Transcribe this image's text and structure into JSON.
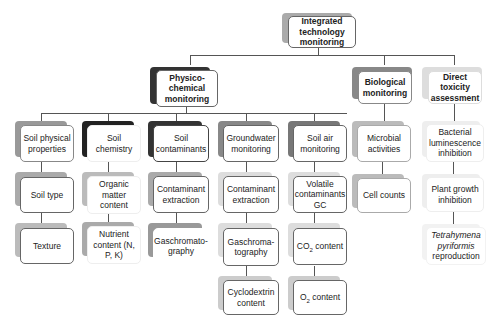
{
  "diagram": {
    "root": {
      "label": "Integrated technology monitoring"
    },
    "level1": [
      {
        "label": "Physico-chemical monitoring"
      },
      {
        "label": "Biological monitoring"
      },
      {
        "label": "Direct toxicity assessment"
      }
    ],
    "physico_children": [
      {
        "label": "Soil physical properties",
        "items": [
          "Soil type",
          "Texture"
        ]
      },
      {
        "label": "Soil chemistry",
        "items": [
          "Organic matter content",
          "Nutrient content (N, P, K)"
        ]
      },
      {
        "label": "Soil contaminants",
        "items": [
          "Contaminant extraction",
          "Gaschromato-graphy"
        ]
      },
      {
        "label": "Groundwater monitoring",
        "items": [
          "Contaminant extraction",
          "Gaschroma-tography",
          "Cyclodextrin content"
        ]
      },
      {
        "label": "Soil air monitoring",
        "items": [
          "Volatile contaminants GC",
          "CO",
          "O"
        ]
      }
    ],
    "soil_air_extra": {
      "co2_suffix": " content",
      "o2_suffix": " content",
      "sub": "2"
    },
    "biological_children": [
      "Microbial activities",
      "Cell counts"
    ],
    "toxicity_children": [
      "Bacterial luminescence inhibition",
      "Plant growth inhibition"
    ],
    "tetrahymena": {
      "italic": "Tetrahymena pyriformis",
      "rest": "reproduction"
    }
  }
}
